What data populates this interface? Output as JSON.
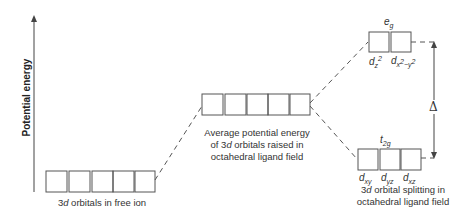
{
  "diagram": {
    "type": "crystal-field-splitting-energy-diagram",
    "y_axis_label": "Potential energy",
    "levels": [
      {
        "id": "free-ion",
        "orbitals": 5,
        "label_prefix": "3",
        "label_italic": "d",
        "label_suffix": " orbitals in free ion"
      },
      {
        "id": "average",
        "orbitals": 5,
        "label_line1": "Average potential energy",
        "label_line2_pre": "of 3",
        "label_line2_italic": "d",
        "label_line2_post": " orbitals raised in",
        "label_line3": "octahedral ligand field"
      },
      {
        "id": "eg",
        "orbitals": 2,
        "group_label": "e",
        "group_sub": "g",
        "orbital_labels": [
          "d_z2",
          "d_x2-y2"
        ]
      },
      {
        "id": "t2g",
        "orbitals": 3,
        "group_label": "t",
        "group_sub": "2g",
        "orbital_labels": [
          "d_xy",
          "d_yz",
          "d_xz"
        ]
      }
    ],
    "splitting_label_pre": "3",
    "splitting_label_italic": "d",
    "splitting_label_post": " orbital splitting in",
    "splitting_label_line2": "octahedral ligand field",
    "gap_symbol": "Δ",
    "colors": {
      "line": "#555555",
      "text": "#333333"
    }
  }
}
